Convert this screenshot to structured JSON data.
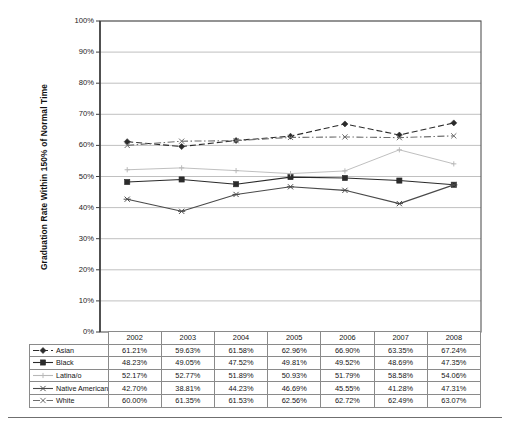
{
  "chart_data": {
    "type": "line",
    "title": "",
    "xlabel": "",
    "ylabel": "Graduation Rate Within 150% of Normal Time",
    "ylim": [
      0,
      100
    ],
    "ytick_labels": [
      "0%",
      "10%",
      "20%",
      "30%",
      "40%",
      "50%",
      "60%",
      "70%",
      "80%",
      "90%",
      "100%"
    ],
    "ytick_values": [
      0,
      10,
      20,
      30,
      40,
      50,
      60,
      70,
      80,
      90,
      100
    ],
    "grid": true,
    "legend_position": "data-table",
    "categories": [
      "2002",
      "2003",
      "2004",
      "2005",
      "2006",
      "2007",
      "2008"
    ],
    "series": [
      {
        "name": "Asian",
        "marker": "diamond",
        "dash": "dashed",
        "color": "#2b2b2b",
        "values": [
          61.21,
          59.63,
          61.58,
          62.96,
          66.9,
          63.35,
          67.24
        ],
        "labels": [
          "61.21%",
          "59.63%",
          "61.58%",
          "62.96%",
          "66.90%",
          "63.35%",
          "67.24%"
        ]
      },
      {
        "name": "Black",
        "marker": "square",
        "dash": "solid",
        "color": "#2b2b2b",
        "values": [
          48.23,
          49.05,
          47.52,
          49.81,
          49.52,
          48.69,
          47.35
        ],
        "labels": [
          "48.23%",
          "49.05%",
          "47.52%",
          "49.81%",
          "49.52%",
          "48.69%",
          "47.35%"
        ]
      },
      {
        "name": "Latina/o",
        "marker": "plus",
        "dash": "solid",
        "color": "#b8b8b8",
        "values": [
          52.17,
          52.77,
          51.89,
          50.93,
          51.79,
          58.58,
          54.06
        ],
        "labels": [
          "52.17%",
          "52.77%",
          "51.89%",
          "50.93%",
          "51.79%",
          "58.58%",
          "54.06%"
        ]
      },
      {
        "name": "Native American",
        "marker": "x-bar",
        "dash": "solid",
        "color": "#4a4a4a",
        "values": [
          42.7,
          38.81,
          44.23,
          46.69,
          45.55,
          41.28,
          47.31
        ],
        "labels": [
          "42.70%",
          "38.81%",
          "44.23%",
          "46.69%",
          "45.55%",
          "41.28%",
          "47.31%"
        ]
      },
      {
        "name": "White",
        "marker": "cross",
        "dash": "dash-dot",
        "color": "#6e6e6e",
        "values": [
          60.0,
          61.35,
          61.53,
          62.56,
          62.72,
          62.49,
          63.07
        ],
        "labels": [
          "60.00%",
          "61.35%",
          "61.53%",
          "62.56%",
          "62.72%",
          "62.49%",
          "63.07%"
        ]
      }
    ]
  },
  "data_table": {
    "corner_label": "",
    "column_headers": [
      "2002",
      "2003",
      "2004",
      "2005",
      "2006",
      "2007",
      "2008"
    ],
    "rows": [
      {
        "label": "Asian",
        "values": [
          "61.21%",
          "59.63%",
          "61.58%",
          "62.96%",
          "66.90%",
          "63.35%",
          "67.24%"
        ]
      },
      {
        "label": "Black",
        "values": [
          "48.23%",
          "49.05%",
          "47.52%",
          "49.81%",
          "49.52%",
          "48.69%",
          "47.35%"
        ]
      },
      {
        "label": "Latina/o",
        "values": [
          "52.17%",
          "52.77%",
          "51.89%",
          "50.93%",
          "51.79%",
          "58.58%",
          "54.06%"
        ]
      },
      {
        "label": "Native American",
        "values": [
          "42.70%",
          "38.81%",
          "44.23%",
          "46.69%",
          "45.55%",
          "41.28%",
          "47.31%"
        ]
      },
      {
        "label": "White",
        "values": [
          "60.00%",
          "61.35%",
          "61.53%",
          "62.56%",
          "62.72%",
          "62.49%",
          "63.07%"
        ]
      }
    ]
  },
  "colors": {
    "plot_border": "#555555",
    "gridline": "#b0b0b0",
    "table_border": "#8a8a8a",
    "rule": "#6f6f6f",
    "text": "#141414"
  }
}
